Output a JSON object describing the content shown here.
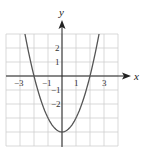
{
  "chart_data": {
    "type": "line",
    "title": "",
    "xlabel": "x",
    "ylabel": "y",
    "function": "y = x^2 - 4",
    "xlim": [
      -4,
      4
    ],
    "ylim": [
      -5,
      3
    ],
    "grid": true,
    "x_tick_labels": [
      "-3",
      "-1",
      "1",
      "3"
    ],
    "x_tick_values": [
      -3,
      -1,
      1,
      3
    ],
    "y_tick_labels": [
      "2",
      "1",
      "-1",
      "-2"
    ],
    "y_tick_values": [
      2,
      1,
      -1,
      -2
    ],
    "series": [
      {
        "name": "parabola",
        "x": [
          -2.65,
          -2.5,
          -2,
          -1.5,
          -1,
          -0.5,
          0,
          0.5,
          1,
          1.5,
          2,
          2.5,
          2.65
        ],
        "y": [
          3.02,
          2.25,
          0,
          -1.75,
          -3,
          -3.75,
          -4,
          -3.75,
          -3,
          -1.75,
          0,
          2.25,
          3.02
        ],
        "color": "#555555"
      }
    ],
    "key_points": {
      "vertex": [
        0,
        -4
      ],
      "x_intercepts": [
        [
          -2,
          0
        ],
        [
          2,
          0
        ]
      ],
      "y_intercept": [
        0,
        -4
      ]
    }
  },
  "colors": {
    "grid": "#cfcfcf",
    "axis": "#222222",
    "curve": "#555555"
  }
}
